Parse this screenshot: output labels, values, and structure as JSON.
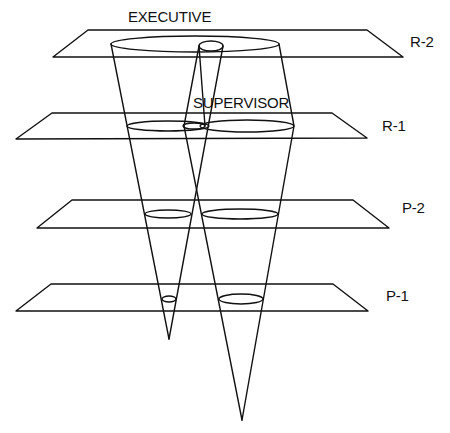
{
  "diagram": {
    "labels": {
      "executive": "EXECUTIVE",
      "supervisor": "SUPERVISOR"
    },
    "planes": [
      {
        "label": "R-2"
      },
      {
        "label": "R-1"
      },
      {
        "label": "P-2"
      },
      {
        "label": "P-1"
      }
    ],
    "colors": {
      "line": "#111111",
      "background": "#ffffff"
    }
  }
}
